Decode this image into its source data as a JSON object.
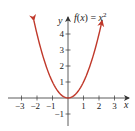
{
  "chart_data": {
    "type": "line",
    "title": "",
    "function_label": "f(x) = x²",
    "function_label_parts": {
      "lhs": "f(x) = x",
      "exp": "2"
    },
    "xlabel": "x",
    "ylabel": "y",
    "xlim": [
      -3.5,
      3.8
    ],
    "ylim": [
      -1.7,
      5.1
    ],
    "x_ticks": [
      -3,
      -2,
      -1,
      1,
      2,
      3
    ],
    "x_tick_labels": [
      "−3",
      "−2",
      "−1",
      "1",
      "2",
      "3"
    ],
    "y_ticks": [
      -1,
      1,
      2,
      3,
      4
    ],
    "y_tick_labels": [
      "−1",
      "1",
      "2",
      "3",
      "4"
    ],
    "grid": false,
    "series": [
      {
        "name": "f(x) = x^2",
        "color": "#c0392b",
        "x": [
          -2.2,
          -2,
          -1.5,
          -1,
          -0.5,
          0,
          0.5,
          1,
          1.5,
          2,
          2.2
        ],
        "y": [
          4.84,
          4,
          2.25,
          1,
          0.25,
          0,
          0.25,
          1,
          2.25,
          4,
          4.84
        ],
        "arrows_at_ends": true
      }
    ]
  },
  "colors": {
    "curve": "#c0392b",
    "axis": "#333333"
  }
}
